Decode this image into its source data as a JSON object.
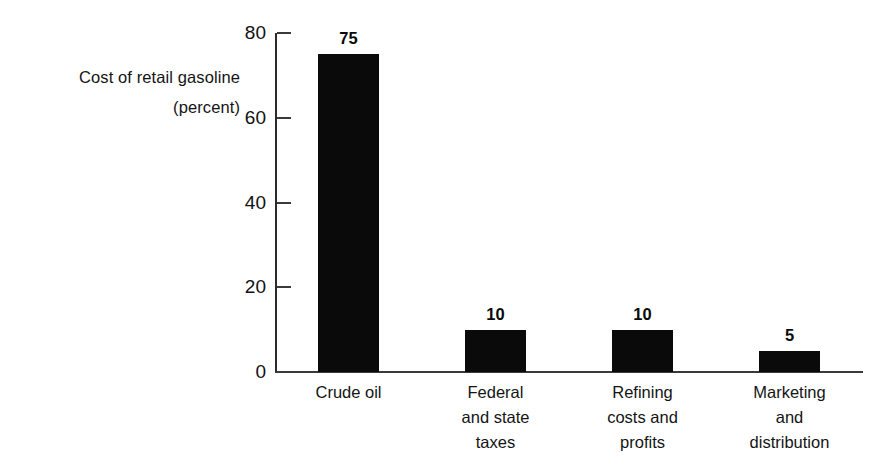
{
  "chart_data": {
    "type": "bar",
    "title": "",
    "subtitle": "",
    "xlabel": "",
    "ylabel": "Cost of retail gasoline (percent)",
    "ylabel_lines": [
      "Cost of retail gasoline",
      "(percent)"
    ],
    "categories": [
      "Crude oil",
      "Federal and state taxes",
      "Refining costs and profits",
      "Marketing and distribution"
    ],
    "category_label_lines": [
      [
        "Crude oil"
      ],
      [
        "Federal",
        "and state",
        "taxes"
      ],
      [
        "Refining",
        "costs and",
        "profits"
      ],
      [
        "Marketing",
        "and",
        "distribution"
      ]
    ],
    "values": [
      75,
      10,
      10,
      5
    ],
    "value_labels": [
      "75",
      "10",
      "10",
      "5"
    ],
    "ylim": [
      0,
      80
    ],
    "yticks": [
      0,
      20,
      40,
      60,
      80
    ],
    "ytick_labels": [
      "0",
      "20",
      "40",
      "60",
      "80"
    ],
    "grid": false,
    "legend": "none",
    "bar_color": "#0a0a0a",
    "axis_color": "#3a3a3a",
    "background_color": "#ffffff"
  }
}
